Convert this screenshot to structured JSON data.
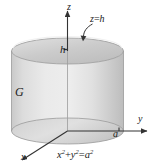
{
  "figure": {
    "background_color": "#ffffff"
  },
  "axes": {
    "z_label": "z",
    "y_label": "y",
    "x_label": "x",
    "axis_color": "#333333"
  },
  "labels": {
    "height_tick": "h",
    "radius_tick": "a",
    "region": "G"
  },
  "annotations": {
    "top_plane": {
      "lhs": "z",
      "op": "=",
      "rhs": "h"
    },
    "base_equation": {
      "term1_base": "x",
      "term1_exp": "2",
      "plus": "+",
      "term2_base": "y",
      "term2_exp": "2",
      "equals": "=",
      "rhs_base": "a",
      "rhs_exp": "2"
    }
  },
  "geometry": {
    "cylinder_fill_light": "#e9e9e9",
    "cylinder_fill_mid": "#d3d3d3",
    "cylinder_fill_dark": "#bfbfbf",
    "top_face_fill": "#cfcfcf",
    "outline_color": "#8c8c8c",
    "center_x": 67.5,
    "radius_x": 56,
    "radius_y": 13,
    "top_y": 51,
    "bottom_y": 131
  }
}
